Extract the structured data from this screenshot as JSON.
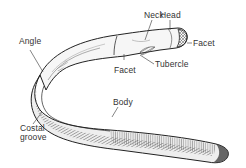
{
  "diagram": {
    "labels": {
      "neck": "Neck",
      "head": "Head",
      "facet_head": "Facet",
      "angle": "Angle",
      "facet_tubercle": "Facet",
      "tubercle": "Tubercle",
      "body": "Body",
      "costal_groove_line1": "Costal",
      "costal_groove_line2": "groove"
    },
    "colors": {
      "bone_fill": "#f4f4f4",
      "bone_outline": "#222222",
      "hatch": "#555555",
      "leader_line": "#333333",
      "label_text": "#333333",
      "background": "#ffffff"
    }
  }
}
